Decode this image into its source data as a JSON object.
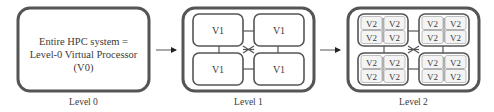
{
  "diagram": {
    "colors": {
      "stroke": "#555555",
      "inner_stroke": "#777777",
      "fill": "#ffffff",
      "text": "#3a3a3a",
      "inner_fill": "#f4f4f4"
    },
    "levels": [
      {
        "name": "Level 0",
        "caption": "Level 0",
        "text_lines": [
          "Entire HPC system =",
          "Level-0 Virtual Processor",
          "(V0)"
        ]
      },
      {
        "name": "Level 1",
        "caption": "Level 1",
        "nodes": [
          "V1",
          "V1",
          "V1",
          "V1"
        ]
      },
      {
        "name": "Level 2",
        "caption": "Level 2",
        "groups": [
          {
            "nodes": [
              "V2",
              "V2",
              "V2",
              "V2"
            ]
          },
          {
            "nodes": [
              "V2",
              "V2",
              "V2",
              "V2"
            ]
          },
          {
            "nodes": [
              "V2",
              "V2",
              "V2",
              "V2"
            ]
          },
          {
            "nodes": [
              "V2",
              "V2",
              "V2",
              "V2"
            ]
          }
        ]
      }
    ],
    "arrows": [
      {
        "from": "Level 0",
        "to": "Level 1"
      },
      {
        "from": "Level 1",
        "to": "Level 2"
      }
    ]
  }
}
